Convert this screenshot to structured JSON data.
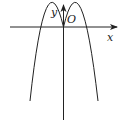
{
  "diagram": {
    "type": "function-graph",
    "labels": {
      "x_axis": "x",
      "y_axis": "y",
      "origin": "O"
    },
    "colors": {
      "stroke": "#222222",
      "background": "#ffffff"
    }
  }
}
